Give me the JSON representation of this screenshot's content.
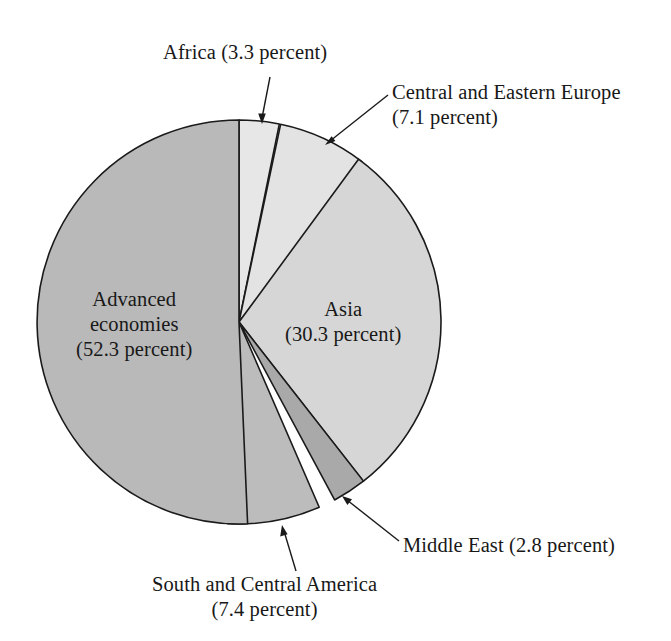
{
  "chart_data": {
    "type": "pie",
    "title": "",
    "subtitle": "",
    "xlabel": "",
    "ylabel": "",
    "legend_position": "none",
    "grid": false,
    "units": "percent",
    "start_angle_deg": 0,
    "direction": "clockwise",
    "categories": [
      "Africa",
      "Central and Eastern Europe",
      "Asia",
      "Middle East",
      "South and Central America",
      "Advanced economies"
    ],
    "values": [
      3.3,
      7.1,
      30.3,
      2.8,
      7.4,
      52.3
    ],
    "slices": [
      {
        "name": "Africa",
        "value": 3.3,
        "value_text": "3.3 percent",
        "label_lines": [
          "Africa (3.3 percent)"
        ],
        "color": "#e7e7e7",
        "label_placement": "outside-top",
        "has_leader_line": true
      },
      {
        "name": "Central and Eastern Europe",
        "value": 7.1,
        "value_text": "7.1 percent",
        "label_lines": [
          "Central and Eastern Europe",
          "(7.1 percent)"
        ],
        "color": "#e3e3e3",
        "label_placement": "outside-top-right",
        "has_leader_line": true
      },
      {
        "name": "Asia",
        "value": 30.3,
        "value_text": "30.3 percent",
        "label_lines": [
          "Asia",
          "(30.3 percent)"
        ],
        "color": "#d6d6d6",
        "label_placement": "inside",
        "has_leader_line": false
      },
      {
        "name": "Middle East",
        "value": 2.8,
        "value_text": "2.8 percent",
        "label_lines": [
          "Middle East (2.8 percent)"
        ],
        "color": "#a9a9a9",
        "label_placement": "outside-bottom-right",
        "has_leader_line": true
      },
      {
        "name": "South and Central America",
        "value": 7.4,
        "value_text": "7.4 percent",
        "label_lines": [
          "South and Central America",
          "(7.4 percent)"
        ],
        "color": "#bcbcbc",
        "label_placement": "outside-bottom",
        "has_leader_line": true
      },
      {
        "name": "Advanced economies",
        "value": 52.3,
        "value_text": "52.3 percent",
        "label_lines": [
          "Advanced",
          "economies",
          "(52.3 percent)"
        ],
        "color": "#b9b9b9",
        "label_placement": "inside",
        "has_leader_line": false
      }
    ],
    "colors": {
      "background": "#ffffff",
      "outline": "#1a1a1a",
      "text": "#181818"
    }
  },
  "labels": {
    "africa": {
      "line1": "Africa (3.3 percent)"
    },
    "central_eastern_europe": {
      "line1": "Central and Eastern Europe",
      "line2": "(7.1 percent)"
    },
    "asia": {
      "line1": "Asia",
      "line2": "(30.3 percent)"
    },
    "middle_east": {
      "line1": "Middle East (2.8 percent)"
    },
    "south_central_america": {
      "line1": "South and Central America",
      "line2": "(7.4 percent)"
    },
    "advanced_economies": {
      "line1": "Advanced",
      "line2": "economies",
      "line3": "(52.3 percent)"
    }
  }
}
